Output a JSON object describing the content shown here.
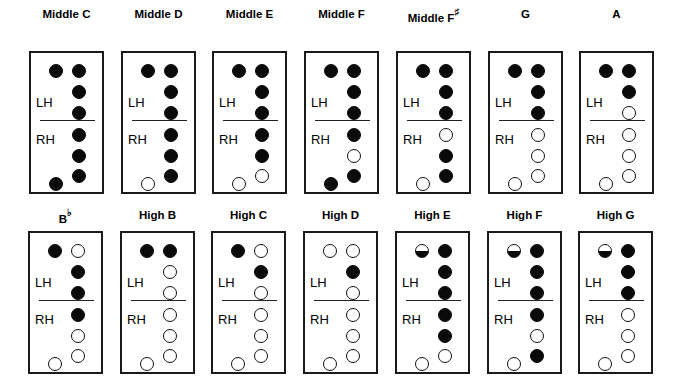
{
  "legend": {
    "closed": "covered hole",
    "open": "uncovered hole",
    "half": "half-covered (pinched) thumb hole"
  },
  "hand_labels": {
    "left": "LH",
    "right": "RH"
  },
  "hole_order": [
    "thumb",
    "L1",
    "L2",
    "L3",
    "R1",
    "R2",
    "R3",
    "R4"
  ],
  "rows": [
    {
      "charts": [
        {
          "note": "Middle C",
          "accidental": "",
          "holes": [
            "closed",
            "closed",
            "closed",
            "closed",
            "closed",
            "closed",
            "closed",
            "closed"
          ]
        },
        {
          "note": "Middle D",
          "accidental": "",
          "holes": [
            "closed",
            "closed",
            "closed",
            "closed",
            "closed",
            "closed",
            "closed",
            "open"
          ]
        },
        {
          "note": "Middle E",
          "accidental": "",
          "holes": [
            "closed",
            "closed",
            "closed",
            "closed",
            "closed",
            "closed",
            "open",
            "open"
          ]
        },
        {
          "note": "Middle F",
          "accidental": "",
          "holes": [
            "closed",
            "closed",
            "closed",
            "closed",
            "closed",
            "open",
            "closed",
            "closed"
          ]
        },
        {
          "note": "Middle F",
          "accidental": "♯",
          "holes": [
            "closed",
            "closed",
            "closed",
            "closed",
            "open",
            "closed",
            "closed",
            "open"
          ]
        },
        {
          "note": "G",
          "accidental": "",
          "holes": [
            "closed",
            "closed",
            "closed",
            "closed",
            "open",
            "open",
            "open",
            "open"
          ]
        },
        {
          "note": "A",
          "accidental": "",
          "holes": [
            "closed",
            "closed",
            "closed",
            "open",
            "open",
            "open",
            "open",
            "open"
          ]
        }
      ]
    },
    {
      "charts": [
        {
          "note": "B",
          "accidental": "♭",
          "holes": [
            "closed",
            "open",
            "closed",
            "closed",
            "closed",
            "open",
            "open",
            "open"
          ]
        },
        {
          "note": "High B",
          "accidental": "",
          "holes": [
            "closed",
            "closed",
            "open",
            "open",
            "open",
            "open",
            "open",
            "open"
          ]
        },
        {
          "note": "High C",
          "accidental": "",
          "holes": [
            "closed",
            "open",
            "closed",
            "open",
            "open",
            "open",
            "open",
            "open"
          ]
        },
        {
          "note": "High D",
          "accidental": "",
          "holes": [
            "open",
            "open",
            "closed",
            "open",
            "open",
            "open",
            "open",
            "open"
          ]
        },
        {
          "note": "High E",
          "accidental": "",
          "holes": [
            "half",
            "closed",
            "closed",
            "closed",
            "closed",
            "closed",
            "open",
            "open"
          ]
        },
        {
          "note": "High F",
          "accidental": "",
          "holes": [
            "half",
            "closed",
            "closed",
            "closed",
            "closed",
            "open",
            "closed",
            "open"
          ]
        },
        {
          "note": "High G",
          "accidental": "",
          "holes": [
            "half",
            "closed",
            "closed",
            "closed",
            "open",
            "open",
            "open",
            "open"
          ]
        }
      ]
    }
  ]
}
